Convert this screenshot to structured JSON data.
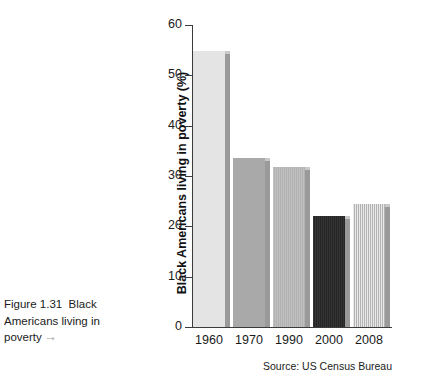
{
  "caption": {
    "line1": "Figure 1.31  Black",
    "line2": "Americans living in",
    "line3": "poverty",
    "arrow": "→"
  },
  "source": "Source: US Census Bureau",
  "chart_data": {
    "type": "bar",
    "title": "",
    "xlabel": "",
    "ylabel": "Black Americans living in poverty (%)",
    "categories": [
      "1960",
      "1970",
      "1990",
      "2000",
      "2008"
    ],
    "values": [
      54.8,
      33.5,
      31.8,
      22.1,
      24.4
    ],
    "ylim": [
      0,
      60
    ],
    "yticks": [
      "0",
      "10",
      "20",
      "30",
      "40",
      "50",
      "60"
    ],
    "grid": false,
    "legend": "none",
    "bar_colors": [
      "#e4e4e4",
      "#a9a9a9",
      "#bfbfbf",
      "#333333",
      "#e9e9e9"
    ],
    "bar_textures": [
      "plain",
      "plain",
      "striped",
      "striped",
      "striped"
    ],
    "axis_color": "#3b3b3b",
    "source": "Source: US Census Bureau"
  }
}
